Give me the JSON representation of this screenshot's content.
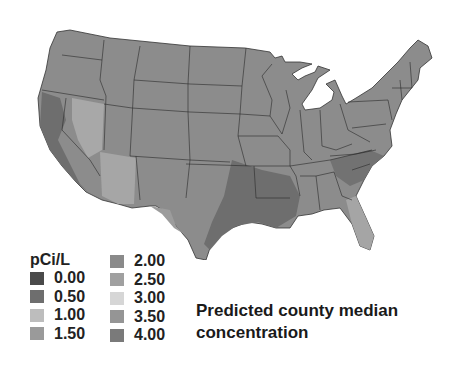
{
  "map": {
    "subject": "United States (contiguous) county map",
    "title": "Predicted county median concentration",
    "unit": "pCi/L"
  },
  "legend": {
    "title": "pCi/L",
    "col1": [
      {
        "label": "0.00",
        "color": "#4a4a4a"
      },
      {
        "label": "0.50",
        "color": "#6e6e6e"
      },
      {
        "label": "1.00",
        "color": "#bdbdbd"
      },
      {
        "label": "1.50",
        "color": "#9a9a9a"
      }
    ],
    "col2": [
      {
        "label": "2.00",
        "color": "#8a8a8a"
      },
      {
        "label": "2.50",
        "color": "#a0a0a0"
      },
      {
        "label": "3.00",
        "color": "#d6d6d6"
      },
      {
        "label": "3.50",
        "color": "#959595"
      },
      {
        "label": "4.00",
        "color": "#7a7a7a"
      }
    ]
  },
  "caption": {
    "line1": "Predicted county median",
    "line2": "concentration"
  }
}
